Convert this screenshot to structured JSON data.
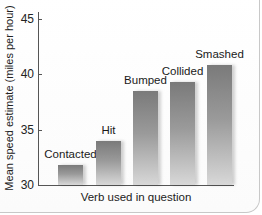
{
  "chart_data": {
    "type": "bar",
    "title": "",
    "xlabel": "Verb used in question",
    "ylabel": "Mean speed estimate (miles per hour)",
    "categories": [
      "Contacted",
      "Hit",
      "Bumped",
      "Collided",
      "Smashed"
    ],
    "values": [
      31.8,
      34.0,
      38.5,
      39.3,
      40.8
    ],
    "ylim": [
      30,
      45
    ],
    "yticks": [
      30,
      35,
      40,
      45
    ],
    "grid": false,
    "legend": null,
    "bar_labels_above": true
  },
  "axis": {
    "ytick_labels": [
      "45",
      "40",
      "35",
      "30"
    ]
  }
}
